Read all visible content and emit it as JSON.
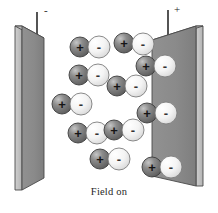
{
  "figure": {
    "caption": "Field on",
    "width": 218,
    "height": 213,
    "background_color": "#ffffff"
  },
  "terminals": {
    "negative": {
      "label": "-",
      "name": "negative-terminal",
      "wire_x": 37,
      "wire_top": 12,
      "wire_bottom": 52
    },
    "positive": {
      "label": "+",
      "name": "positive-terminal",
      "wire_x": 168,
      "wire_top": 10,
      "wire_bottom": 50
    }
  },
  "plates": {
    "left": {
      "name": "left-capacitor-plate",
      "polarity": "negative",
      "face_color": "#8a8a8a",
      "edge_color": "#c2c2c2",
      "outline_color": "#4a4a4a",
      "face_points": "22,26 44,38 44,178 22,190",
      "edge_points": "15,26 22,26 22,190 15,190",
      "top_points": "15,26 22,26 44,38 37,38"
    },
    "right": {
      "name": "right-capacitor-plate",
      "polarity": "positive",
      "face_color": "#8a8a8a",
      "edge_color": "#c2c2c2",
      "outline_color": "#4a4a4a",
      "face_points": "152,40 196,26 196,186 152,176",
      "edge_points": "196,26 203,26 203,186 196,186",
      "top_points": "152,40 196,26 203,26 159,40"
    }
  },
  "legend": {
    "positive_sphere": {
      "name": "positive-ion-sphere",
      "charge_symbol": "+",
      "fill_color": "#6e6e6e",
      "highlight_color": "#b8b8b8",
      "outline_color": "#3c3c3c",
      "radius": 10
    },
    "negative_sphere": {
      "name": "negative-ion-sphere",
      "charge_symbol": "-",
      "fill_color": "#f2f2f2",
      "highlight_color": "#ffffff",
      "outline_color": "#7d7d7d",
      "radius": 11
    }
  },
  "dipoles": [
    {
      "id": "dipole-1",
      "plus_cx": 80,
      "plus_cy": 47,
      "minus_cx": 99,
      "minus_cy": 47
    },
    {
      "id": "dipole-2",
      "plus_cx": 124,
      "plus_cy": 43,
      "minus_cx": 143,
      "minus_cy": 44
    },
    {
      "id": "dipole-3",
      "plus_cx": 79,
      "plus_cy": 75,
      "minus_cx": 98,
      "minus_cy": 75
    },
    {
      "id": "dipole-4",
      "plus_cx": 146,
      "plus_cy": 66,
      "minus_cx": 165,
      "minus_cy": 66
    },
    {
      "id": "dipole-5",
      "plus_cx": 117,
      "plus_cy": 86,
      "minus_cx": 136,
      "minus_cy": 86
    },
    {
      "id": "dipole-6",
      "plus_cx": 62,
      "plus_cy": 104,
      "minus_cx": 81,
      "minus_cy": 104
    },
    {
      "id": "dipole-7",
      "plus_cx": 147,
      "plus_cy": 113,
      "minus_cx": 166,
      "minus_cy": 113
    },
    {
      "id": "dipole-8",
      "plus_cx": 78,
      "plus_cy": 133,
      "minus_cx": 97,
      "minus_cy": 133
    },
    {
      "id": "dipole-9",
      "plus_cx": 114,
      "plus_cy": 130,
      "minus_cx": 133,
      "minus_cy": 130
    },
    {
      "id": "dipole-10",
      "plus_cx": 100,
      "plus_cy": 159,
      "minus_cx": 119,
      "minus_cy": 159
    },
    {
      "id": "dipole-11",
      "plus_cx": 152,
      "plus_cy": 167,
      "minus_cx": 171,
      "minus_cy": 167
    }
  ]
}
